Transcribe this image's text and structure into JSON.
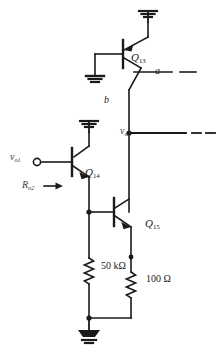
{
  "figure": {
    "background_color": "#ffffff",
    "line_color": "#1a1a1a",
    "label_color": "#1a1a1a",
    "dim_label_color": "#3a3a3a"
  },
  "components": {
    "q13": {
      "label": "Q",
      "subscript": "13",
      "type": "pnp-transistor",
      "name": "Q13"
    },
    "q14": {
      "label": "Q",
      "subscript": "14",
      "type": "npn-transistor",
      "name": "Q14"
    },
    "q15": {
      "label": "Q",
      "subscript": "15",
      "type": "npn-transistor",
      "name": "Q15"
    },
    "r50k": {
      "value": "50 kΩ",
      "type": "resistor"
    },
    "r100": {
      "value": "100 Ω",
      "type": "resistor"
    }
  },
  "nodes": {
    "a": {
      "label": "a"
    },
    "b": {
      "label": "b"
    },
    "vo2": {
      "label": "v",
      "subscript": "o2"
    },
    "vo1": {
      "label": "v",
      "subscript": "o1"
    }
  },
  "annotations": {
    "ro2": {
      "label": "R",
      "subscript": "o2",
      "arrow": "right-arrow-icon"
    }
  },
  "grounds": {
    "top_ground": "ground-icon",
    "q13_base_ground": "ground-icon",
    "q14_collector_ground": "ground-icon",
    "bottom_ground": "ground-icon"
  },
  "terminals": {
    "vo1_terminal": "open-circle-terminal"
  }
}
